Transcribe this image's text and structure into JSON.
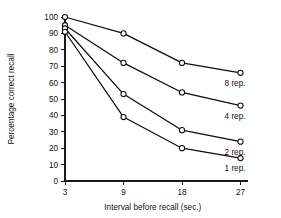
{
  "chart_data": {
    "type": "line",
    "title": "",
    "xlabel": "Interval before recall (sec.)",
    "ylabel": "Percentage correct recall",
    "categories": [
      "3",
      "9",
      "18",
      "27"
    ],
    "x": [
      3,
      9,
      18,
      27
    ],
    "ylim": [
      0,
      100
    ],
    "yticks": [
      "0",
      "10",
      "20",
      "30",
      "40",
      "50",
      "60",
      "70",
      "80",
      "90",
      "100"
    ],
    "xticks": [
      "3",
      "9",
      "18",
      "27"
    ],
    "grid": false,
    "legend_position": "right-inline-endpoint-labels",
    "marker": "open-circle",
    "line_color": "#0d0d0d",
    "marker_fill": "#ffffff",
    "background": "#ffffff",
    "series": [
      {
        "name": "8 rep.",
        "values": [
          100,
          90,
          72,
          66
        ]
      },
      {
        "name": "4 rep.",
        "values": [
          95,
          72,
          54,
          46
        ]
      },
      {
        "name": "2 rep.",
        "values": [
          93,
          53,
          31,
          24
        ]
      },
      {
        "name": "1 rep.",
        "values": [
          91,
          39,
          20,
          14
        ]
      }
    ]
  }
}
